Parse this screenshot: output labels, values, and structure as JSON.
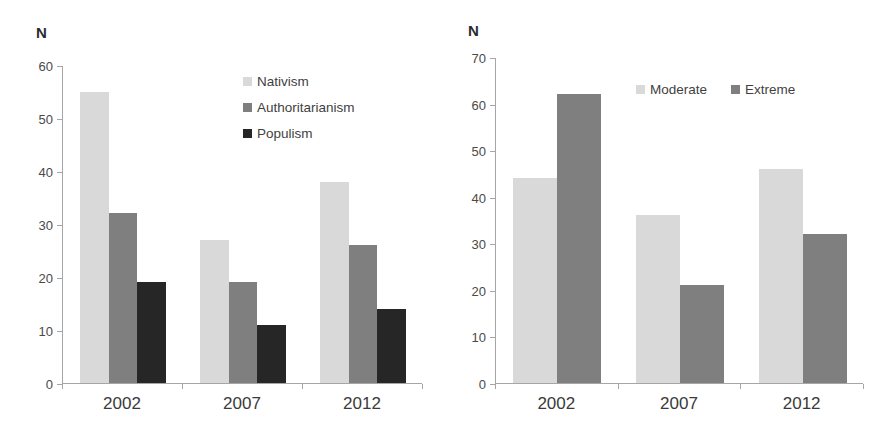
{
  "chart_data": [
    {
      "type": "bar",
      "title": "",
      "panel_name": "left-panel",
      "xlabel": "",
      "ylabel": "N",
      "ylim": [
        0,
        60
      ],
      "ytick_step": 10,
      "yticks": [
        0,
        10,
        20,
        30,
        40,
        50,
        60
      ],
      "grid": false,
      "legend_position": "upper-right",
      "categories": [
        "2002",
        "2007",
        "2012"
      ],
      "series": [
        {
          "name": "Nativism",
          "color": "#d9d9d9",
          "values": [
            55,
            27,
            38
          ]
        },
        {
          "name": "Authoritarianism",
          "color": "#7f7f7f",
          "values": [
            32,
            19,
            26
          ]
        },
        {
          "name": "Populism",
          "color": "#262626",
          "values": [
            19,
            11,
            14
          ]
        }
      ]
    },
    {
      "type": "bar",
      "title": "",
      "panel_name": "right-panel",
      "xlabel": "",
      "ylabel": "N",
      "ylim": [
        0,
        70
      ],
      "ytick_step": 10,
      "yticks": [
        0,
        10,
        20,
        30,
        40,
        50,
        60,
        70
      ],
      "grid": false,
      "legend_position": "upper-right",
      "categories": [
        "2002",
        "2007",
        "2012"
      ],
      "series": [
        {
          "name": "Moderate",
          "color": "#d9d9d9",
          "values": [
            44,
            36,
            46
          ]
        },
        {
          "name": "Extreme",
          "color": "#7f7f7f",
          "values": [
            62,
            21,
            32
          ]
        }
      ]
    }
  ]
}
